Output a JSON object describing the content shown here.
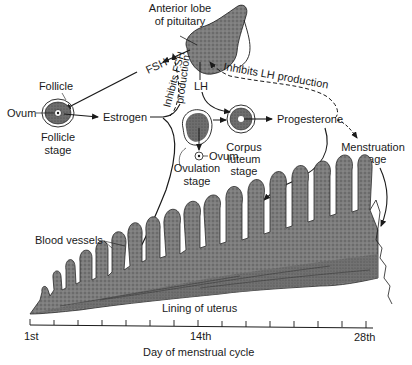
{
  "diagram": {
    "nodes": {
      "pituitary": {
        "label_line1": "Anterior lobe",
        "label_line2": "of pituitary"
      },
      "follicle": {
        "label": "Follicle",
        "ovum_label": "Ovum",
        "stage_line1": "Follicle",
        "stage_line2": "stage"
      },
      "estrogen": {
        "label": "Estrogen"
      },
      "ovulation": {
        "ovum_label": "Ovum",
        "stage_line1": "Ovulation",
        "stage_line2": "stage"
      },
      "corpus_luteum": {
        "stage_line1": "Corpus",
        "stage_line2": "luteum",
        "stage_line3": "stage"
      },
      "progesterone": {
        "label": "Progesterone"
      },
      "menstruation": {
        "stage_line1": "Menstruation",
        "stage_line2": "stage"
      },
      "blood_vessels": {
        "label": "Blood vessels"
      },
      "uterus_lining": {
        "label": "Lining of uterus"
      }
    },
    "hormones": {
      "fsh": "FSH",
      "lh": "LH"
    },
    "feedback": {
      "inhibits_fsh_line1": "Inhibits FSH",
      "inhibits_fsh_line2": "production",
      "inhibits_lh": "Inhibits LH production"
    },
    "axis": {
      "label": "Day of menstrual cycle",
      "ticks": [
        "1st",
        "14th",
        "28th"
      ],
      "tick_count": 15
    },
    "colors": {
      "ink": "#1a1a1a",
      "tissue": "#7a7a7a",
      "tissue_dark": "#555555",
      "background": "#ffffff"
    }
  }
}
